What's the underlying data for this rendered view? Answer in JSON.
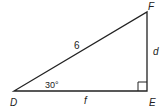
{
  "diagram": {
    "type": "right-triangle",
    "vertices": {
      "D": "D",
      "E": "E",
      "F": "F"
    },
    "sides": {
      "hypotenuse_DF": "6",
      "side_EF": "d",
      "side_DE": "f"
    },
    "angle_D": "30°",
    "right_angle_at": "E",
    "colors": {
      "stroke": "#222222",
      "background": "#ffffff"
    }
  }
}
